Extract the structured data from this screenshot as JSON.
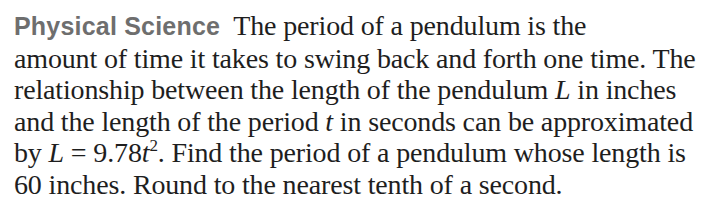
{
  "problem": {
    "heading": "Physical Science",
    "lines": [
      "The period of a pendulum is the",
      "amount of time it takes to swing back and forth one time. The",
      "relationship between the length of the pendulum",
      "in inches",
      "and the length of the period",
      "in seconds can be approximated",
      "by",
      "= 9.78",
      ". Find the period of a pendulum whose length is",
      "60 inches. Round to the nearest tenth of a second."
    ],
    "variables": {
      "length": "L",
      "time": "t",
      "exponent": "2"
    },
    "equation": "L = 9.78t^2",
    "given_length": "60 inches",
    "rounding": "nearest tenth of a second"
  },
  "colors": {
    "heading": "#6e6e6e",
    "body_text": "#1e1e1e",
    "background": "#ffffff"
  }
}
